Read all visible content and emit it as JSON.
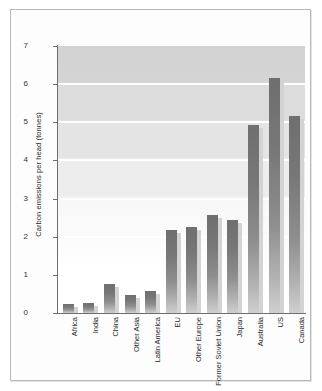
{
  "chart_data": {
    "type": "bar",
    "title": "",
    "subtitle": "",
    "xlabel": "",
    "ylabel": "Carbon emissions per head (tonnes)",
    "categories": [
      "Africa",
      "India",
      "China",
      "Other Asia",
      "Latin America",
      "EU",
      "Other Europe",
      "Former Soviet Union",
      "Japan",
      "Australia",
      "US",
      "Canada"
    ],
    "values": [
      0.24,
      0.25,
      0.75,
      0.48,
      0.58,
      2.17,
      2.25,
      2.58,
      2.44,
      4.92,
      6.15,
      5.17
    ],
    "ylim": [
      0,
      7
    ],
    "ytick_labels": [
      "0",
      "1",
      "2",
      "3",
      "4",
      "5",
      "6",
      "7"
    ],
    "ytick_values": [
      0,
      1,
      2,
      3,
      4,
      5,
      6,
      7
    ],
    "grid": "horizontal-white-gridlines",
    "legend": "none",
    "bar_color": "#7b7b7b",
    "bar_shadow_color": "#d3d3d3",
    "plot_background": "#d2d2d2-to-#ffffff vertical gradient",
    "axis_color": "#6e6e6e",
    "frame_border_color": "#b9b9b9"
  }
}
